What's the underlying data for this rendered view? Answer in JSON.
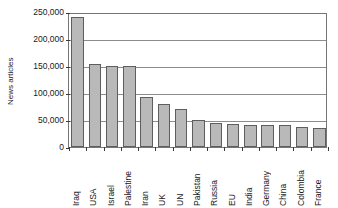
{
  "chart_data": {
    "type": "bar",
    "title": "",
    "xlabel": "",
    "ylabel": "News articles",
    "ylim": [
      0,
      250000
    ],
    "ytick_values": [
      250000,
      200000,
      150000,
      100000,
      50000,
      0
    ],
    "ytick_labels": [
      "250,000",
      "200,000",
      "150,000",
      "100,000",
      "50,000",
      "0"
    ],
    "grid": true,
    "legend": "none",
    "bar_color": "#b9b9b9",
    "bar_border_color": "#5e5e5e",
    "axis_color": "#767676",
    "gridline_color": "#8c8c8c",
    "categories": [
      "Iraq",
      "USA",
      "Israel",
      "Palestine",
      "Iran",
      "UK",
      "UN",
      "Pakistan",
      "Russia",
      "EU",
      "India",
      "Germany",
      "China",
      "Colombia",
      "France"
    ],
    "values": [
      240000,
      154000,
      150000,
      150000,
      92000,
      80000,
      70000,
      50000,
      44000,
      43000,
      41000,
      41000,
      40000,
      37000,
      35000
    ]
  }
}
